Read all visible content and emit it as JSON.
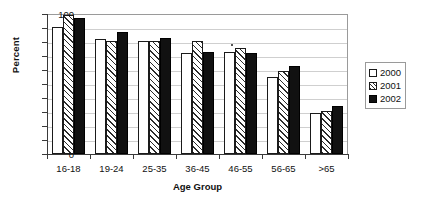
{
  "chart_data": {
    "type": "bar",
    "title": "",
    "xlabel": "Age Group",
    "ylabel": "Percent",
    "categories": [
      "16-18",
      "19-24",
      "25-35",
      "36-45",
      "46-55",
      "56-65",
      ">65"
    ],
    "series": [
      {
        "name": "2000",
        "values": [
          91,
          82,
          81,
          72,
          73,
          55,
          29
        ],
        "fill": "white",
        "color": "#ffffff"
      },
      {
        "name": "2001",
        "values": [
          99,
          81,
          81,
          81,
          76,
          59,
          31
        ],
        "fill": "hatched",
        "color": "#2b2b2b"
      },
      {
        "name": "2002",
        "values": [
          97,
          87,
          83,
          73,
          72,
          63,
          34
        ],
        "fill": "solid",
        "color": "#111111"
      }
    ],
    "ylim": [
      0,
      100
    ],
    "ytick_step": 10,
    "yticks": [
      "100",
      "90",
      "80",
      "70",
      "60",
      "50",
      "40",
      "30",
      "20",
      "10",
      "0"
    ],
    "grid": true,
    "grid_axis": "y",
    "legend_position": "right"
  },
  "legend": {
    "entries": [
      {
        "label": "2000",
        "swatch": "white-square-icon"
      },
      {
        "label": "2001",
        "swatch": "hatched-square-icon"
      },
      {
        "label": "2002",
        "swatch": "black-square-icon"
      }
    ]
  }
}
